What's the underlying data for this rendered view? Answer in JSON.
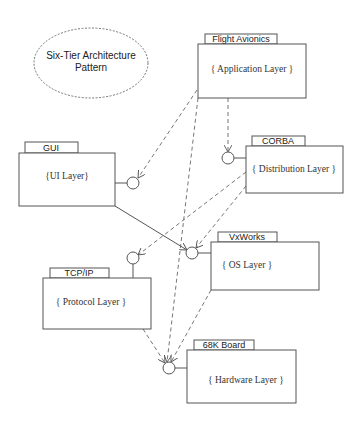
{
  "diagram": {
    "title_note": {
      "line1": "Six-Tier Architecture",
      "line2": "Pattern"
    },
    "packages": [
      {
        "id": "flight-avionics",
        "tab": "Flight Avionics",
        "label": "{ Application Layer }"
      },
      {
        "id": "gui",
        "tab": "GUI",
        "label": "{UI Layer}"
      },
      {
        "id": "corba",
        "tab": "CORBA",
        "label": "{ Distribution Layer }"
      },
      {
        "id": "vxworks",
        "tab": "VxWorks",
        "label": "{ OS Layer }"
      },
      {
        "id": "tcpip",
        "tab": "TCP/IP",
        "label": "{ Protocol Layer }"
      },
      {
        "id": "68k-board",
        "tab": "68K Board",
        "label": "{ Hardware Layer }"
      }
    ],
    "dependencies": [
      {
        "from": "Flight Avionics",
        "to": "GUI",
        "style": "dashed"
      },
      {
        "from": "Flight Avionics",
        "to": "CORBA",
        "style": "dashed"
      },
      {
        "from": "Flight Avionics",
        "to": "68K Board",
        "style": "dashed"
      },
      {
        "from": "GUI",
        "to": "VxWorks",
        "style": "solid"
      },
      {
        "from": "CORBA",
        "to": "TCP/IP",
        "style": "dashed"
      },
      {
        "from": "CORBA",
        "to": "VxWorks",
        "style": "dashed"
      },
      {
        "from": "TCP/IP",
        "to": "68K Board",
        "style": "dashed"
      },
      {
        "from": "VxWorks",
        "to": "68K Board",
        "style": "dashed"
      }
    ],
    "colors": {
      "line": "#555555",
      "background": "#ffffff"
    }
  }
}
